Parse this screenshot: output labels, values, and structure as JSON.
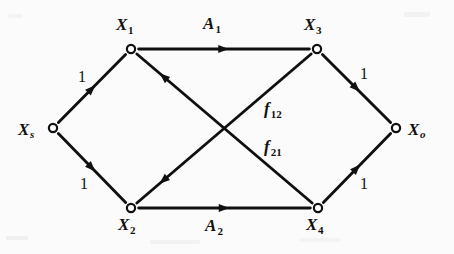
{
  "figure": {
    "kind": "directed-flow-network-diagram",
    "background_color": "#fbfbfb",
    "ink_color": "#12100f",
    "width": 454,
    "height": 254
  },
  "nodes": [
    {
      "id": "Xs",
      "base": "X",
      "sub": "s",
      "x": 53,
      "y": 128,
      "label_x": 18,
      "label_y": 121,
      "sub_italic": true
    },
    {
      "id": "X1",
      "base": "X",
      "sub": "1",
      "x": 131,
      "y": 49,
      "label_x": 116,
      "label_y": 16,
      "sub_italic": false
    },
    {
      "id": "X2",
      "base": "X",
      "sub": "2",
      "x": 131,
      "y": 208,
      "label_x": 118,
      "label_y": 216,
      "sub_italic": false
    },
    {
      "id": "X3",
      "base": "X",
      "sub": "3",
      "x": 317,
      "y": 49,
      "label_x": 304,
      "label_y": 16,
      "sub_italic": false
    },
    {
      "id": "X4",
      "base": "X",
      "sub": "4",
      "x": 318,
      "y": 208,
      "label_x": 306,
      "label_y": 216,
      "sub_italic": false
    },
    {
      "id": "Xo",
      "base": "X",
      "sub": "o",
      "x": 396,
      "y": 128,
      "label_x": 408,
      "label_y": 121,
      "sub_italic": true
    }
  ],
  "edges": [
    {
      "id": "Xs-X1",
      "from": "Xs",
      "to": "X1",
      "label": "1",
      "label_kind": "weight",
      "label_x": 78,
      "label_y": 69,
      "arrow_t": 0.5
    },
    {
      "id": "Xs-X2",
      "from": "Xs",
      "to": "X2",
      "label": "1",
      "label_kind": "weight",
      "label_x": 80,
      "label_y": 176,
      "arrow_t": 0.5
    },
    {
      "id": "X1-X3",
      "from": "X1",
      "to": "X3",
      "base": "A",
      "sub": "1",
      "label_kind": "flow",
      "label_x": 203,
      "label_y": 15,
      "arrow_t": 0.5
    },
    {
      "id": "X2-X4",
      "from": "X2",
      "to": "X4",
      "base": "A",
      "sub": "2",
      "label_kind": "flow",
      "label_x": 205,
      "label_y": 217,
      "arrow_t": 0.5
    },
    {
      "id": "X3-Xo",
      "from": "X3",
      "to": "Xo",
      "label": "1",
      "label_kind": "weight",
      "label_x": 360,
      "label_y": 66,
      "arrow_t": 0.5
    },
    {
      "id": "X4-Xo",
      "from": "X4",
      "to": "Xo",
      "label": "1",
      "label_kind": "weight",
      "label_x": 360,
      "label_y": 176,
      "arrow_t": 0.5
    },
    {
      "id": "X3-X2",
      "from": "X3",
      "to": "X2",
      "base": "f",
      "sub": "12",
      "label_kind": "flow",
      "label_x": 264,
      "label_y": 100,
      "arrow_t": 0.85
    },
    {
      "id": "X4-X1",
      "from": "X4",
      "to": "X1",
      "base": "f",
      "sub": "21",
      "label_kind": "flow",
      "label_x": 264,
      "label_y": 138,
      "arrow_t": 0.85
    }
  ]
}
